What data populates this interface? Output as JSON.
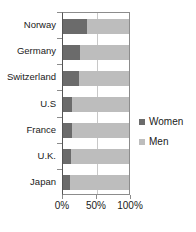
{
  "chart_data": {
    "type": "bar",
    "subtype": "stacked-horizontal-100-percent",
    "title": "",
    "xlabel": "",
    "ylabel": "",
    "categories": [
      "Norway",
      "Germany",
      "Switzerland",
      "U.S",
      "France",
      "U.K.",
      "Japan"
    ],
    "series": [
      {
        "name": "Women",
        "color": "#6b6b6b",
        "values": [
          37,
          25,
          24,
          13,
          13,
          12,
          10
        ]
      },
      {
        "name": "Men",
        "color": "#bdbdbd",
        "values": [
          63,
          75,
          76,
          87,
          87,
          88,
          90
        ]
      }
    ],
    "xlim": [
      0,
      100
    ],
    "xticks": [
      0,
      50,
      100
    ],
    "xticklabels": [
      "0%",
      "50%",
      "100%"
    ],
    "grid": true,
    "legend_position": "right"
  },
  "legend": {
    "items": [
      {
        "label": "Women",
        "color": "#6b6b6b"
      },
      {
        "label": "Men",
        "color": "#bdbdbd"
      }
    ]
  },
  "colors": {
    "women": "#6b6b6b",
    "men": "#bdbdbd",
    "axis": "#8c8c8c",
    "grid": "#c8c8c8",
    "text": "#1a1a1a",
    "background": "#ffffff"
  }
}
